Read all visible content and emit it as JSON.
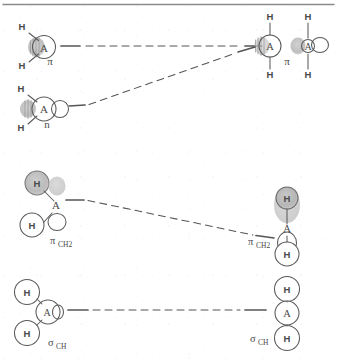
{
  "figure": {
    "type": "orbital-correlation-diagram",
    "title": "",
    "background_color": "#ffffff",
    "ink_color": "#4a4a4a",
    "shade_color": "#b9b9b9",
    "top_rule": true
  },
  "labels": {
    "pi": "π",
    "n": "n",
    "pi_ch2_base": "π",
    "pi_ch2_sub": "CH2",
    "sigma_ch_base": "σ",
    "sigma_ch_sub": "CH",
    "atom_A": "A",
    "atom_H": "H"
  },
  "rows": [
    {
      "name": "pi-row",
      "left_label": "π",
      "right_label": "π",
      "left_atoms": [
        "H",
        "A",
        "H"
      ],
      "right_atoms": [
        "H",
        "A",
        "H"
      ],
      "connector": "dashed"
    },
    {
      "name": "n-row",
      "left_label": "n",
      "right_label": "π",
      "left_atoms": [
        "H",
        "A",
        "H"
      ],
      "right_atoms": [
        "H",
        "A",
        "H"
      ],
      "connector": "dashed"
    },
    {
      "name": "pi-ch2-row",
      "left_label_base": "π",
      "left_label_sub": "CH2",
      "right_label_base": "π",
      "right_label_sub": "CH2",
      "left_atoms": [
        "H",
        "A",
        "H"
      ],
      "right_atoms": [
        "H",
        "A",
        "H"
      ],
      "connector": "dashed"
    },
    {
      "name": "sigma-ch-row",
      "left_label_base": "σ",
      "left_label_sub": "CH",
      "right_label_base": "σ",
      "right_label_sub": "CH",
      "left_atoms": [
        "H",
        "A",
        "H"
      ],
      "right_atoms": [
        "H",
        "A",
        "H"
      ],
      "connector": "dashed"
    }
  ]
}
